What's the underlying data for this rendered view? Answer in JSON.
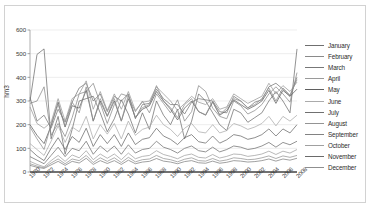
{
  "chart_data": {
    "type": "line",
    "title": "",
    "xlabel": "",
    "ylabel": "hm3",
    "ylim": [
      0,
      600
    ],
    "ytick_labels": [
      "0",
      "100",
      "200",
      "300",
      "400",
      "500",
      "600"
    ],
    "ytick_values": [
      0,
      100,
      200,
      300,
      400,
      500,
      600
    ],
    "grid": true,
    "legend_position": "right",
    "x": [
      1970,
      1971,
      1972,
      1973,
      1974,
      1975,
      1976,
      1977,
      1978,
      1979,
      1980,
      1981,
      1982,
      1983,
      1984,
      1985,
      1986,
      1987,
      1988,
      1989,
      1990,
      1991,
      1992,
      1993,
      1994,
      1995,
      1996,
      1997,
      1998,
      1999,
      2000,
      2001,
      2002,
      2003,
      2004,
      2005,
      2006,
      2007,
      2008
    ],
    "xtick_labels": [
      "1970",
      "1972",
      "1974",
      "1976",
      "1978",
      "1980",
      "1982",
      "1984",
      "1986",
      "1988",
      "1990",
      "1992",
      "1994",
      "1996",
      "1998",
      "2000",
      "2002",
      "2004",
      "2006",
      "2008"
    ],
    "series": [
      {
        "name": "January",
        "color": "#6f6f6f",
        "values": [
          300,
          497,
          520,
          140,
          235,
          75,
          180,
          300,
          310,
          320,
          250,
          170,
          225,
          305,
          245,
          165,
          250,
          180,
          300,
          240,
          200,
          265,
          140,
          215,
          330,
          300,
          250,
          200,
          175,
          265,
          250,
          210,
          230,
          250,
          300,
          340,
          300,
          250,
          520
        ]
      },
      {
        "name": "February",
        "color": "#8a8a8a",
        "values": [
          290,
          300,
          360,
          155,
          205,
          150,
          230,
          330,
          340,
          375,
          290,
          205,
          285,
          330,
          320,
          255,
          300,
          250,
          330,
          290,
          250,
          305,
          215,
          255,
          365,
          340,
          270,
          235,
          225,
          300,
          280,
          245,
          260,
          285,
          330,
          360,
          330,
          295,
          420
        ]
      },
      {
        "name": "March",
        "color": "#777777",
        "values": [
          315,
          215,
          240,
          185,
          265,
          210,
          295,
          355,
          375,
          300,
          330,
          255,
          320,
          300,
          330,
          225,
          285,
          290,
          350,
          310,
          285,
          285,
          245,
          295,
          310,
          305,
          300,
          255,
          250,
          320,
          300,
          270,
          295,
          305,
          360,
          375,
          350,
          320,
          400
        ]
      },
      {
        "name": "April",
        "color": "#9a9a9a",
        "values": [
          275,
          205,
          185,
          210,
          310,
          215,
          310,
          330,
          385,
          265,
          340,
          260,
          330,
          265,
          340,
          260,
          295,
          300,
          360,
          330,
          300,
          260,
          290,
          320,
          295,
          285,
          310,
          265,
          275,
          330,
          310,
          290,
          305,
          320,
          375,
          330,
          365,
          340,
          380
        ]
      },
      {
        "name": "May",
        "color": "#5f5f5f",
        "values": [
          200,
          155,
          120,
          195,
          295,
          190,
          280,
          270,
          345,
          215,
          300,
          235,
          300,
          215,
          310,
          230,
          265,
          280,
          340,
          300,
          265,
          220,
          270,
          300,
          255,
          240,
          295,
          240,
          260,
          305,
          285,
          265,
          280,
          300,
          345,
          290,
          345,
          320,
          350
        ]
      },
      {
        "name": "June",
        "color": "#ababab",
        "values": [
          120,
          95,
          70,
          130,
          195,
          125,
          190,
          170,
          235,
          140,
          200,
          160,
          205,
          140,
          215,
          155,
          180,
          190,
          240,
          200,
          180,
          150,
          185,
          205,
          170,
          165,
          200,
          165,
          175,
          205,
          195,
          180,
          190,
          205,
          235,
          195,
          235,
          215,
          240
        ]
      },
      {
        "name": "July",
        "color": "#707070",
        "values": [
          65,
          50,
          35,
          70,
          105,
          65,
          100,
          90,
          130,
          75,
          110,
          85,
          110,
          75,
          115,
          80,
          95,
          100,
          130,
          105,
          95,
          80,
          100,
          110,
          90,
          85,
          105,
          85,
          95,
          110,
          105,
          95,
          100,
          110,
          125,
          105,
          125,
          115,
          130
        ]
      },
      {
        "name": "August",
        "color": "#949494",
        "values": [
          35,
          25,
          18,
          38,
          55,
          35,
          55,
          48,
          70,
          40,
          60,
          45,
          60,
          40,
          62,
          43,
          52,
          55,
          70,
          57,
          52,
          43,
          54,
          60,
          48,
          46,
          57,
          46,
          51,
          60,
          57,
          52,
          54,
          60,
          68,
          57,
          68,
          62,
          70
        ]
      },
      {
        "name": "September",
        "color": "#828282",
        "values": [
          28,
          20,
          15,
          30,
          45,
          28,
          45,
          38,
          58,
          32,
          48,
          36,
          48,
          32,
          50,
          35,
          42,
          45,
          57,
          46,
          42,
          35,
          44,
          48,
          39,
          37,
          46,
          37,
          41,
          48,
          46,
          42,
          44,
          48,
          55,
          46,
          55,
          50,
          58
        ]
      },
      {
        "name": "October",
        "color": "#a0a0a0",
        "values": [
          45,
          32,
          22,
          48,
          70,
          45,
          72,
          60,
          90,
          52,
          76,
          58,
          76,
          52,
          80,
          56,
          66,
          70,
          90,
          74,
          66,
          56,
          70,
          76,
          62,
          59,
          74,
          59,
          66,
          76,
          74,
          66,
          70,
          76,
          88,
          74,
          88,
          80,
          95
        ]
      },
      {
        "name": "November",
        "color": "#6a6a6a",
        "values": [
          95,
          68,
          48,
          100,
          145,
          95,
          150,
          125,
          185,
          108,
          158,
          120,
          158,
          108,
          165,
          116,
          138,
          145,
          185,
          152,
          138,
          116,
          145,
          158,
          128,
          122,
          152,
          122,
          136,
          158,
          152,
          138,
          145,
          158,
          182,
          152,
          182,
          165,
          200
        ]
      },
      {
        "name": "December",
        "color": "#8f8f8f",
        "values": [
          190,
          140,
          95,
          200,
          285,
          190,
          295,
          250,
          360,
          215,
          310,
          238,
          310,
          215,
          325,
          230,
          272,
          285,
          365,
          300,
          272,
          230,
          285,
          310,
          255,
          242,
          300,
          242,
          270,
          310,
          300,
          272,
          285,
          310,
          355,
          300,
          355,
          325,
          390
        ]
      }
    ]
  },
  "legend": {
    "items": [
      {
        "label": "January"
      },
      {
        "label": "February"
      },
      {
        "label": "March"
      },
      {
        "label": "April"
      },
      {
        "label": "May"
      },
      {
        "label": "June"
      },
      {
        "label": "July"
      },
      {
        "label": "August"
      },
      {
        "label": "September"
      },
      {
        "label": "October"
      },
      {
        "label": "November"
      },
      {
        "label": "December"
      }
    ]
  }
}
